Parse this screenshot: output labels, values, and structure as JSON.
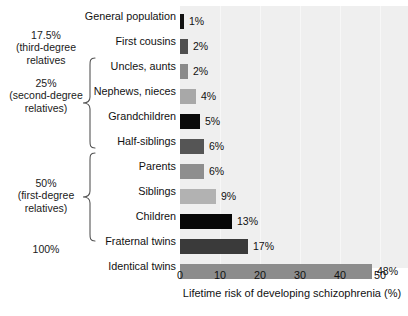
{
  "chart_data": {
    "type": "bar",
    "orientation": "horizontal",
    "title": "",
    "xlabel": "Lifetime risk of developing schizophrenia (%)",
    "ylabel": "",
    "xlim": [
      0,
      57
    ],
    "xticks": [
      0,
      10,
      20,
      30,
      40,
      50
    ],
    "xtick_labels": [
      "0",
      "10",
      "20",
      "30",
      "40",
      "50"
    ],
    "grid": true,
    "legend": "none",
    "categories": [
      "General population",
      "First cousins",
      "Uncles, aunts",
      "Nephews, nieces",
      "Grandchildren",
      "Half-siblings",
      "Parents",
      "Siblings",
      "Children",
      "Fraternal twins",
      "Identical twins"
    ],
    "values": [
      1,
      2,
      2,
      4,
      5,
      6,
      6,
      9,
      13,
      17,
      48
    ],
    "value_labels": [
      "1%",
      "2%",
      "2%",
      "4%",
      "5%",
      "6%",
      "6%",
      "9%",
      "13%",
      "17%",
      "48%"
    ],
    "bar_colors": [
      "#121212",
      "#4f4f4f",
      "#8a8a8a",
      "#a8a8a8",
      "#0b0b0b",
      "#555555",
      "#8e8e8e",
      "#b2b2b2",
      "#070707",
      "#3a3a3a",
      "#8c8c8c"
    ],
    "plot_background": "#efefef",
    "annotations": [
      {
        "name": "third-degree",
        "text": "17.5%\n(third-degree\nrelatives",
        "has_brace": false
      },
      {
        "name": "second-degree",
        "text": "25%\n(second-degree\nrelatives)",
        "has_brace": true
      },
      {
        "name": "first-degree",
        "text": "50%\n(first-degree\nrelatives)",
        "has_brace": true
      },
      {
        "name": "identical",
        "text": "100%",
        "has_brace": false
      }
    ]
  }
}
